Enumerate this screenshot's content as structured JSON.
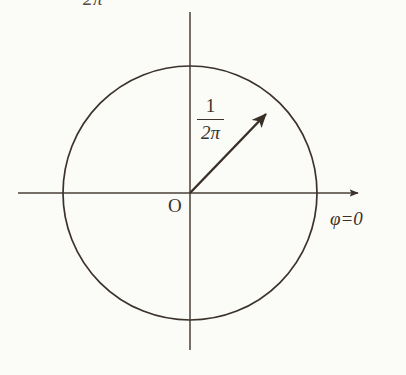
{
  "figure": {
    "background_color": "#fbfbf7",
    "ink_color": "#3b322c"
  },
  "labels": {
    "top_angle": "2π",
    "origin": "O",
    "phase_axis": "φ=0",
    "radius_numerator": "1",
    "radius_denominator": "2π"
  },
  "geometry": {
    "circle": {
      "center_x": 190,
      "center_y": 193,
      "radius": 127
    },
    "horizontal_axis": {
      "x_start": 18,
      "x_end": 365,
      "y": 193,
      "arrow": "right"
    },
    "vertical_axis": {
      "x": 190,
      "y_start": 12,
      "y_end": 350,
      "arrow": "none"
    },
    "radius_vector": {
      "from_x": 190,
      "from_y": 193,
      "to_x": 274,
      "to_y": 106,
      "angle_degrees": 46,
      "arrow": "tip"
    }
  }
}
